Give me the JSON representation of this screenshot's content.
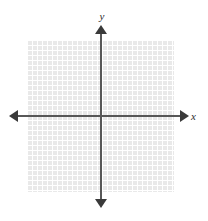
{
  "figure": {
    "kind": "cartesian-coordinate-plane",
    "background_color": "#ffffff",
    "width": 208,
    "height": 221
  },
  "chart_data": {
    "type": "scatter",
    "title": "",
    "subtitle": "",
    "xlabel": "x",
    "ylabel": "y",
    "xlim": [
      -14.8,
      14.6
    ],
    "ylim": [
      -15.2,
      15.2
    ],
    "xtick_labels": [],
    "ytick_labels": [],
    "grid": true,
    "grid_spacing": 1,
    "grid_columns": 29,
    "grid_rows": 30,
    "legend": null,
    "legend_position": "none",
    "series": [],
    "annotations": [],
    "origin": {
      "x": 0,
      "y": 0
    },
    "axis_arrows": [
      "left",
      "right",
      "up",
      "down"
    ],
    "colors": {
      "grid_fill": "#e9e9e9",
      "grid_line": "#ffffff",
      "axis_line": "#585858",
      "arrow_fill": "#3a3a3a",
      "label_text": "#2b2b2b"
    }
  },
  "labels": {
    "y_axis": "y",
    "x_axis": "x"
  },
  "icons": {
    "arrow_left": "arrow-left-icon",
    "arrow_right": "arrow-right-icon",
    "arrow_up": "arrow-up-icon",
    "arrow_down": "arrow-down-icon"
  }
}
